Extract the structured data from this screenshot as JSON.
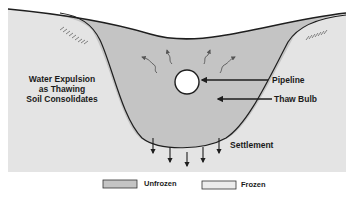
{
  "diagram": {
    "colors": {
      "background": "#ffffff",
      "frozen": "#e4e4e4",
      "unfrozen": "#c4c4c4",
      "line": "#1e1e1e",
      "pipeline_fill": "#ffffff"
    },
    "labels": {
      "water_expulsion": [
        "Water Expulsion",
        "as Thawing",
        "Soil Consolidates"
      ],
      "pipeline": "Pipeline",
      "thaw_bulb": "Thaw Bulb",
      "settlement": "Settlement"
    },
    "legend": [
      {
        "label": "Unfrozen",
        "color": "#c4c4c4"
      },
      {
        "label": "Frozen",
        "color": "#e4e4e4"
      }
    ],
    "elements": {
      "pipeline": {
        "shape": "circle"
      },
      "water_flow_arrows": 4,
      "settlement_arrows": 5,
      "hatch_marks": 2
    }
  }
}
